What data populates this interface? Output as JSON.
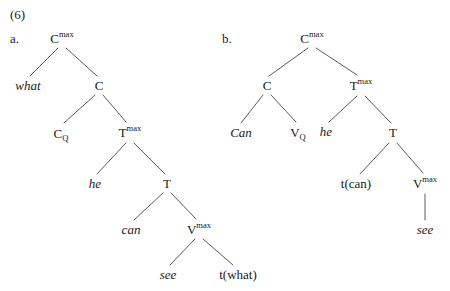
{
  "figure": {
    "number_label": "(6)",
    "trees": [
      {
        "letter": "a.",
        "letter_x": 10,
        "letter_y": 38,
        "nodes": [
          {
            "name": "node-cmax-a",
            "text": "C",
            "sup": "max",
            "sub": "",
            "style": "roman",
            "x": 62,
            "y": 38
          },
          {
            "name": "node-what-a",
            "text": "what",
            "sup": "",
            "sub": "",
            "style": "ital",
            "x": 28,
            "y": 85
          },
          {
            "name": "node-c-a",
            "text": "C",
            "sup": "",
            "sub": "",
            "style": "roman",
            "x": 99,
            "y": 85
          },
          {
            "name": "node-cq-a",
            "text": "C",
            "sup": "",
            "sub": "Q",
            "style": "roman",
            "x": 61,
            "y": 133
          },
          {
            "name": "node-tmax-a",
            "text": "T",
            "sup": "max",
            "sub": "",
            "style": "roman",
            "x": 130,
            "y": 132
          },
          {
            "name": "node-he-a",
            "text": "he",
            "sup": "",
            "sub": "",
            "style": "ital",
            "x": 95,
            "y": 183
          },
          {
            "name": "node-t-a",
            "text": "T",
            "sup": "",
            "sub": "",
            "style": "roman",
            "x": 167,
            "y": 183
          },
          {
            "name": "node-can-a",
            "text": "can",
            "sup": "",
            "sub": "",
            "style": "ital",
            "x": 131,
            "y": 229
          },
          {
            "name": "node-vmax-a",
            "text": "V",
            "sup": "max",
            "sub": "",
            "style": "roman",
            "x": 199,
            "y": 229
          },
          {
            "name": "node-see-a",
            "text": "see",
            "sup": "",
            "sub": "",
            "style": "ital",
            "x": 168,
            "y": 274
          },
          {
            "name": "node-t-what-a",
            "text": "t(what)",
            "sup": "",
            "sub": "",
            "style": "roman",
            "x": 238,
            "y": 274
          }
        ],
        "branches": [
          {
            "name": "branch-cmax-what-a",
            "x1": 58,
            "y1": 48,
            "x2": 30,
            "y2": 76
          },
          {
            "name": "branch-cmax-c-a",
            "x1": 66,
            "y1": 48,
            "x2": 97,
            "y2": 76
          },
          {
            "name": "branch-c-cq-a",
            "x1": 95,
            "y1": 95,
            "x2": 64,
            "y2": 123
          },
          {
            "name": "branch-c-tmax-a",
            "x1": 103,
            "y1": 95,
            "x2": 126,
            "y2": 122
          },
          {
            "name": "branch-tmax-he-a",
            "x1": 126,
            "y1": 143,
            "x2": 97,
            "y2": 174
          },
          {
            "name": "branch-tmax-t-a",
            "x1": 134,
            "y1": 143,
            "x2": 165,
            "y2": 174
          },
          {
            "name": "branch-t-can-a",
            "x1": 163,
            "y1": 193,
            "x2": 134,
            "y2": 220
          },
          {
            "name": "branch-t-vmax-a",
            "x1": 171,
            "y1": 193,
            "x2": 196,
            "y2": 219
          },
          {
            "name": "branch-vmax-see-a",
            "x1": 195,
            "y1": 239,
            "x2": 170,
            "y2": 265
          },
          {
            "name": "branch-vmax-twhat-a",
            "x1": 203,
            "y1": 239,
            "x2": 233,
            "y2": 265
          }
        ]
      },
      {
        "letter": "b.",
        "letter_x": 222,
        "letter_y": 38,
        "nodes": [
          {
            "name": "node-cmax-b",
            "text": "C",
            "sup": "max",
            "sub": "",
            "style": "roman",
            "x": 312,
            "y": 38
          },
          {
            "name": "node-c-b",
            "text": "C",
            "sup": "",
            "sub": "",
            "style": "roman",
            "x": 267,
            "y": 85
          },
          {
            "name": "node-tmax-b",
            "text": "T",
            "sup": "max",
            "sub": "",
            "style": "roman",
            "x": 361,
            "y": 85
          },
          {
            "name": "node-can-b",
            "text": "Can",
            "sup": "",
            "sub": "",
            "style": "ital",
            "x": 241,
            "y": 132
          },
          {
            "name": "node-vq-b",
            "text": "V",
            "sup": "",
            "sub": "Q",
            "style": "roman",
            "x": 298,
            "y": 132
          },
          {
            "name": "node-he-b",
            "text": "he",
            "sup": "",
            "sub": "",
            "style": "ital",
            "x": 326,
            "y": 131
          },
          {
            "name": "node-t-b",
            "text": "T",
            "sup": "",
            "sub": "",
            "style": "roman",
            "x": 393,
            "y": 132
          },
          {
            "name": "node-t-can-b",
            "text": "t(can)",
            "sup": "",
            "sub": "",
            "style": "roman",
            "x": 356,
            "y": 183
          },
          {
            "name": "node-vmax-b",
            "text": "V",
            "sup": "max",
            "sub": "",
            "style": "roman",
            "x": 425,
            "y": 183
          },
          {
            "name": "node-see-b",
            "text": "see",
            "sup": "",
            "sub": "",
            "style": "ital",
            "x": 425,
            "y": 229
          }
        ],
        "branches": [
          {
            "name": "branch-cmax-c-b",
            "x1": 308,
            "y1": 48,
            "x2": 269,
            "y2": 76
          },
          {
            "name": "branch-cmax-tmax-b",
            "x1": 316,
            "y1": 48,
            "x2": 357,
            "y2": 75
          },
          {
            "name": "branch-c-can-b",
            "x1": 263,
            "y1": 95,
            "x2": 241,
            "y2": 123
          },
          {
            "name": "branch-c-vq-b",
            "x1": 271,
            "y1": 95,
            "x2": 296,
            "y2": 122
          },
          {
            "name": "branch-tmax-he-b",
            "x1": 357,
            "y1": 96,
            "x2": 329,
            "y2": 122
          },
          {
            "name": "branch-tmax-t-b",
            "x1": 365,
            "y1": 96,
            "x2": 391,
            "y2": 123
          },
          {
            "name": "branch-t-tcan-b",
            "x1": 389,
            "y1": 143,
            "x2": 360,
            "y2": 174
          },
          {
            "name": "branch-t-vmax-b",
            "x1": 397,
            "y1": 143,
            "x2": 423,
            "y2": 173
          },
          {
            "name": "branch-vmax-see-b",
            "x1": 425,
            "y1": 194,
            "x2": 425,
            "y2": 220
          }
        ]
      }
    ]
  }
}
